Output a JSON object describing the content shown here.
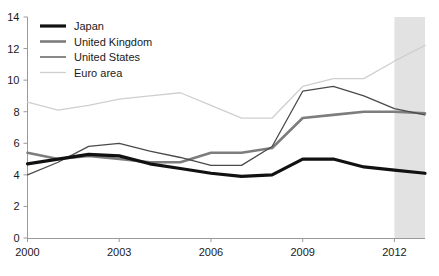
{
  "chart_data": {
    "type": "line",
    "title": "",
    "subtitle": "",
    "xlabel": "",
    "ylabel": "",
    "xlim": [
      2000,
      2013
    ],
    "ylim": [
      0,
      14
    ],
    "ytick_step": 2,
    "grid": false,
    "legend_position": "top-left",
    "x": [
      2000,
      2001,
      2002,
      2003,
      2004,
      2005,
      2006,
      2007,
      2008,
      2009,
      2010,
      2011,
      2012,
      2013
    ],
    "xtick_values": [
      2000,
      2003,
      2006,
      2009,
      2012
    ],
    "xtick_labels": [
      "2000",
      "2003",
      "2006",
      "2009",
      "2012"
    ],
    "ytick_values": [
      0,
      2,
      4,
      6,
      8,
      10,
      12,
      14
    ],
    "ytick_labels": [
      "0",
      "2",
      "4",
      "6",
      "8",
      "10",
      "12",
      "14"
    ],
    "shaded_region": {
      "label": "",
      "x_start": 2012,
      "x_end": 2013,
      "color": "#e2e2e2"
    },
    "series": [
      {
        "name": "Japan",
        "color": "#111111",
        "width": 3.2,
        "values": [
          4.7,
          5.0,
          5.3,
          5.2,
          4.7,
          4.4,
          4.1,
          3.9,
          4.0,
          5.0,
          5.0,
          4.5,
          4.3,
          4.1
        ]
      },
      {
        "name": "United Kingdom",
        "color": "#7d7d7d",
        "width": 2.6,
        "values": [
          5.4,
          5.0,
          5.2,
          5.0,
          4.8,
          4.8,
          5.4,
          5.4,
          5.7,
          7.6,
          7.8,
          8.0,
          8.0,
          7.9
        ]
      },
      {
        "name": "United States",
        "color": "#4a4a4a",
        "width": 1.3,
        "values": [
          4.0,
          4.8,
          5.8,
          6.0,
          5.5,
          5.1,
          4.6,
          4.6,
          5.8,
          9.3,
          9.6,
          9.0,
          8.2,
          7.8
        ]
      },
      {
        "name": "Euro area",
        "color": "#cfcfcf",
        "width": 1.3,
        "values": [
          8.6,
          8.1,
          8.4,
          8.8,
          9.0,
          9.2,
          8.4,
          7.6,
          7.6,
          9.6,
          10.1,
          10.1,
          11.2,
          12.2
        ]
      }
    ]
  },
  "legend": {
    "entries": [
      {
        "label": "Japan"
      },
      {
        "label": "United Kingdom"
      },
      {
        "label": "United States"
      },
      {
        "label": "Euro area"
      }
    ]
  }
}
